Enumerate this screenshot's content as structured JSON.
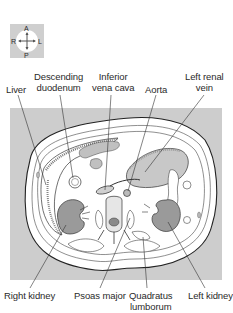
{
  "compass": {
    "anterior": "A",
    "posterior": "P",
    "right": "R",
    "left": "L"
  },
  "labels_top": {
    "liver": "Liver",
    "descending_duodenum_1": "Descending",
    "descending_duodenum_2": "duodenum",
    "inferior_vena_cava_1": "Inferior",
    "inferior_vena_cava_2": "vena cava",
    "aorta": "Aorta",
    "left_renal_vein_1": "Left renal",
    "left_renal_vein_2": "vein"
  },
  "labels_bottom": {
    "right_kidney": "Right kidney",
    "psoas_major": "Psoas major",
    "quadratus_lumborum_1": "Quadratus",
    "quadratus_lumborum_2": "lumborum",
    "left_kidney": "Left kidney"
  },
  "colors": {
    "panel_gray": "#cdcdcd",
    "kidney_gray": "#9a9a9a",
    "line": "#333333"
  }
}
